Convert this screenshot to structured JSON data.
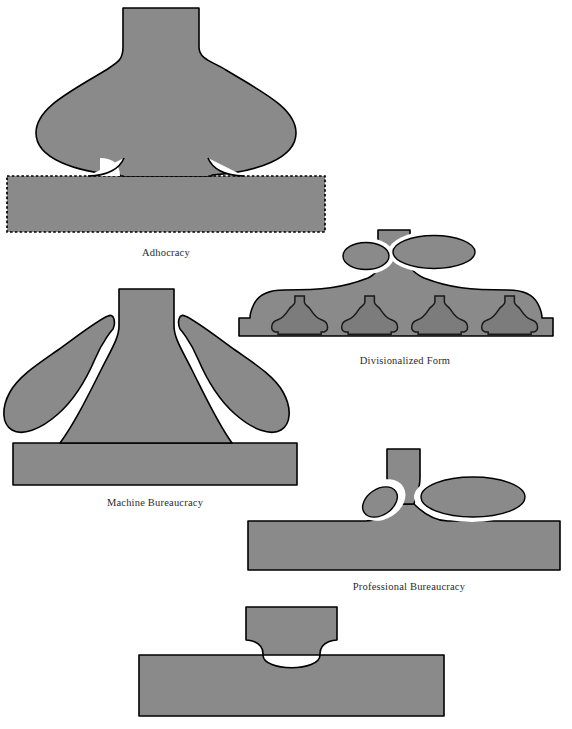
{
  "figure": {
    "title_fragment": "",
    "background_color": "#ffffff",
    "fill_color": "#8a8a8a",
    "mini_fill_color": "#7c7c7c",
    "outline_color": "#000000",
    "gap_color": "#ffffff",
    "label_color": "#2b2b2b"
  },
  "configurations": [
    {
      "id": "adhocracy",
      "label": "Adhocracy",
      "label_x": 166,
      "label_y": 256,
      "parts": [
        "strategic-apex",
        "middle-line",
        "technostructure",
        "support-staff",
        "operating-core"
      ],
      "base_border_style": "dotted"
    },
    {
      "id": "divisionalized-form",
      "label": "Divisionalized Form",
      "label_x": 405,
      "label_y": 364,
      "parts": [
        "strategic-apex",
        "technostructure-ellipse",
        "support-staff-ellipse",
        "middle-line",
        "divisions"
      ],
      "division_count": 4
    },
    {
      "id": "machine-bureaucracy",
      "label": "Machine Bureaucracy",
      "label_x": 155,
      "label_y": 506,
      "parts": [
        "strategic-apex",
        "middle-line",
        "technostructure",
        "support-staff",
        "operating-core"
      ],
      "base_border_style": "solid"
    },
    {
      "id": "professional-bureaucracy",
      "label": "Professional Bureaucracy",
      "label_x": 409,
      "label_y": 590,
      "parts": [
        "strategic-apex",
        "middle-line",
        "technostructure-ellipse",
        "support-staff-ellipse",
        "operating-core"
      ],
      "base_border_style": "solid"
    },
    {
      "id": "simple-structure",
      "label": "",
      "label_x": 310,
      "label_y": 744,
      "parts": [
        "strategic-apex",
        "operating-core"
      ],
      "base_border_style": "solid"
    }
  ]
}
